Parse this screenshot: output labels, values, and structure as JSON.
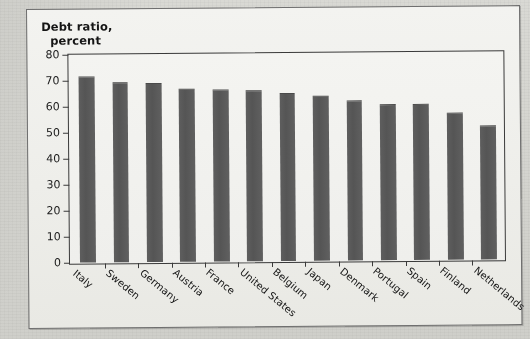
{
  "caption": {
    "line1": "Debt ratio,",
    "line2": "percent"
  },
  "colors": {
    "bar": "#585858",
    "axis": "#3a3a3a",
    "plot_background": "#f1f1ee",
    "figure_background": "#efefec",
    "page_background": "#d3d3ce"
  },
  "ghost_text": [
    {
      "text": "in the rest of the economy. Because the",
      "x": 196,
      "y": 62
    },
    {
      "text": "debt levels in most countries",
      "x": 206,
      "y": 84
    },
    {
      "text": "government debt ratios remain",
      "x": 210,
      "y": 96
    },
    {
      "text": "the economy. Because of that",
      "x": 214,
      "y": 108
    },
    {
      "text": "debt levels in most countries",
      "x": 206,
      "y": 120
    },
    {
      "text": "in the rest of the economy",
      "x": 212,
      "y": 132
    },
    {
      "text": "because of the continued",
      "x": 78,
      "y": 290
    },
    {
      "text": "the debt ratio in the country",
      "x": 196,
      "y": 296
    },
    {
      "text": "remain high in percent",
      "x": 300,
      "y": 308
    }
  ],
  "chart_data": {
    "type": "bar",
    "title": "Debt ratio, percent",
    "xlabel": "",
    "ylabel": "Debt ratio, percent",
    "ylim": [
      0,
      80
    ],
    "yticks": [
      0,
      10,
      20,
      30,
      40,
      50,
      60,
      70,
      80
    ],
    "grid": false,
    "legend": false,
    "categories": [
      "Italy",
      "Sweden",
      "Germany",
      "Austria",
      "France",
      "United States",
      "Belgium",
      "Japan",
      "Denmark",
      "Portugal",
      "Spain",
      "Finland",
      "Netherlands"
    ],
    "values": [
      71,
      68.5,
      68,
      66,
      65.5,
      65,
      64,
      63,
      61,
      59.5,
      59.5,
      56,
      51
    ]
  }
}
